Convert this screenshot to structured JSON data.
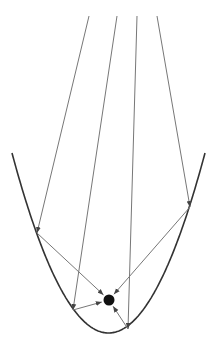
{
  "diagram": {
    "title": "",
    "type": "parabolic-reflector",
    "colors": {
      "curve": "#333333",
      "ray": "#777777",
      "focus": "#111111",
      "background": "#ffffff"
    },
    "parabola": {
      "vertex_x": 108.5,
      "vertex_y": 333,
      "a": 0.01933,
      "x_min": 12,
      "x_max": 205
    },
    "focus": {
      "x": 109,
      "y": 300,
      "r": 5.5
    },
    "rays": [
      {
        "start": [
          89,
          16
        ],
        "hit": [
          37,
          233
        ]
      },
      {
        "start": [
          117,
          16
        ],
        "hit": [
          73,
          310
        ]
      },
      {
        "start": [
          137,
          16
        ],
        "hit": [
          128,
          329
        ]
      },
      {
        "start": [
          157,
          16
        ],
        "hit": [
          190,
          207
        ]
      }
    ]
  }
}
